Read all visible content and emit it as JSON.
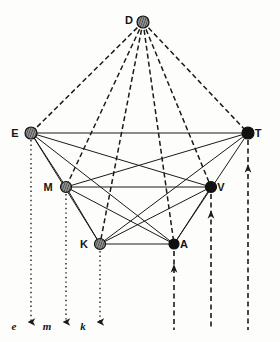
{
  "figure": {
    "background_color": "#fdfdfb",
    "ink_color": "#1a1a1a"
  },
  "nodes": [
    {
      "id": "D",
      "label": "D",
      "x": 143,
      "y": 22,
      "r": 6.0,
      "fill": "hatched",
      "label_dx": -14,
      "label_dy": 2
    },
    {
      "id": "E",
      "label": "E",
      "x": 31,
      "y": 133,
      "r": 6.0,
      "fill": "hatched",
      "label_dx": -16,
      "label_dy": 4
    },
    {
      "id": "T",
      "label": "T",
      "x": 248,
      "y": 133,
      "r": 6.0,
      "fill": "solid",
      "label_dx": 10,
      "label_dy": 4
    },
    {
      "id": "M",
      "label": "M",
      "x": 66,
      "y": 187,
      "r": 5.5,
      "fill": "hatched",
      "label_dx": -18,
      "label_dy": 4
    },
    {
      "id": "V",
      "label": "V",
      "x": 211,
      "y": 187,
      "r": 5.5,
      "fill": "solid",
      "label_dx": 10,
      "label_dy": 4
    },
    {
      "id": "K",
      "label": "K",
      "x": 100,
      "y": 244,
      "r": 5.5,
      "fill": "hatched",
      "label_dx": -16,
      "label_dy": 4
    },
    {
      "id": "A",
      "label": "A",
      "x": 174,
      "y": 244,
      "r": 5.0,
      "fill": "solid",
      "label_dx": 10,
      "label_dy": 4
    }
  ],
  "solid_edges": [
    {
      "from": "E",
      "to": "T"
    },
    {
      "from": "E",
      "to": "M"
    },
    {
      "from": "E",
      "to": "K"
    },
    {
      "from": "E",
      "to": "V"
    },
    {
      "from": "E",
      "to": "A"
    },
    {
      "from": "M",
      "to": "V"
    },
    {
      "from": "M",
      "to": "A"
    },
    {
      "from": "M",
      "to": "T"
    },
    {
      "from": "M",
      "to": "K"
    },
    {
      "from": "K",
      "to": "A"
    },
    {
      "from": "K",
      "to": "V"
    },
    {
      "from": "K",
      "to": "T"
    },
    {
      "from": "A",
      "to": "V"
    },
    {
      "from": "A",
      "to": "T"
    }
  ],
  "dashed_edges": [
    {
      "from": "D",
      "to": "E"
    },
    {
      "from": "D",
      "to": "M"
    },
    {
      "from": "D",
      "to": "K"
    },
    {
      "from": "D",
      "to": "A"
    },
    {
      "from": "D",
      "to": "V"
    },
    {
      "from": "D",
      "to": "T"
    }
  ],
  "dotted_drop_lines": [
    {
      "node": "E",
      "x": 31,
      "y1": 140,
      "y2": 322,
      "label": "e",
      "label_x": 14,
      "label_y": 330,
      "arrow_y": 322
    },
    {
      "node": "M",
      "x": 66,
      "y1": 194,
      "y2": 322,
      "label": "m",
      "label_x": 47,
      "label_y": 330,
      "arrow_y": 322
    },
    {
      "node": "K",
      "x": 100,
      "y1": 251,
      "y2": 322,
      "label": "k",
      "label_x": 83,
      "label_y": 330,
      "arrow_y": 322
    }
  ],
  "dashed_rise_lines": [
    {
      "node": "A",
      "x": 174,
      "y1": 251,
      "y2": 330,
      "arrow_y": 272
    },
    {
      "node": "V",
      "x": 211,
      "y1": 194,
      "y2": 330,
      "arrow_y": 218
    },
    {
      "node": "T",
      "x": 248,
      "y1": 140,
      "y2": 330,
      "arrow_y": 172
    }
  ],
  "axis_labels": [
    {
      "text": "e"
    },
    {
      "text": "m"
    },
    {
      "text": "k"
    }
  ]
}
